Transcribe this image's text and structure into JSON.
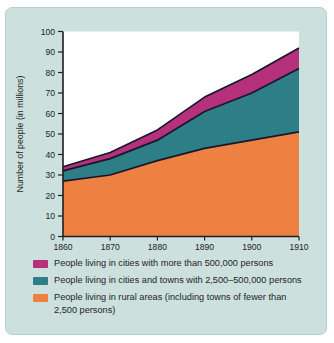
{
  "figure": {
    "background": "#ffffff",
    "panel_bg": "#cce0dd",
    "plot_bg": "#ffffff",
    "axis_color": "#1f1f1f",
    "outline_color": "#17172b",
    "tick_text_color": "#1d1d1d"
  },
  "chart_data": {
    "type": "area",
    "stacked": true,
    "title": "",
    "xlabel": "",
    "ylabel": "Number of people (in millions)",
    "x": [
      1860,
      1870,
      1880,
      1890,
      1900,
      1910
    ],
    "xlim": [
      1860,
      1910
    ],
    "ylim": [
      0,
      100
    ],
    "ytick_step": 10,
    "grid": false,
    "legend_position": "bottom",
    "series": [
      {
        "name": "People living in rural areas (including towns of fewer than 2,500 persons)",
        "color": "#ee8142",
        "values": [
          27,
          30,
          37,
          43,
          47,
          51
        ]
      },
      {
        "name": "People living in cities and towns with 2,500–500,000 persons",
        "color": "#2e7e87",
        "values": [
          5,
          8,
          10,
          18,
          23,
          31
        ]
      },
      {
        "name": "People living in cities with more than 500,000 persons",
        "color": "#b5317c",
        "values": [
          2,
          3,
          5,
          7,
          9,
          10
        ]
      }
    ],
    "cumulative_totals": {
      "rural_top": [
        27,
        30,
        37,
        43,
        47,
        51
      ],
      "towns_top": [
        32,
        38,
        47,
        61,
        70,
        82
      ],
      "cities_top": [
        34,
        41,
        52,
        68,
        79,
        92
      ]
    },
    "legend": [
      {
        "label": "People living in cities with more than 500,000 persons",
        "color": "#b5317c",
        "wrap": false
      },
      {
        "label": "People living in cities and towns with 2,500–500,000 persons",
        "color": "#2e7e87",
        "wrap": false
      },
      {
        "label": "People living in rural areas (including towns of fewer than 2,500 persons)",
        "color": "#ee8142",
        "wrap": true
      }
    ]
  }
}
